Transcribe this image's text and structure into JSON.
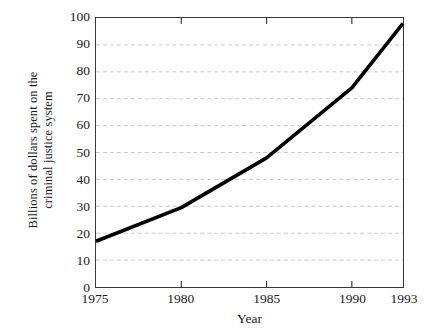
{
  "chart_data": {
    "type": "line",
    "title": "",
    "xlabel": "Year",
    "ylabel_lines": [
      "Billions of dollars spent on the",
      "criminal justice system"
    ],
    "ylabel": "Billions of dollars spent on the criminal justice system",
    "x": [
      1975,
      1980,
      1985,
      1990,
      1993
    ],
    "values": [
      17,
      29.5,
      48,
      74,
      98
    ],
    "series": [
      {
        "name": "Criminal justice spending",
        "values": [
          17,
          29.5,
          48,
          74,
          98
        ]
      }
    ],
    "xlim": [
      1975,
      1993
    ],
    "ylim": [
      0,
      100
    ],
    "xticks": [
      1975,
      1980,
      1985,
      1990,
      1993
    ],
    "xtick_labels": [
      "1975",
      "1980",
      "1985",
      "1990",
      "1993"
    ],
    "yticks": [
      0,
      10,
      20,
      30,
      40,
      50,
      60,
      70,
      80,
      90,
      100
    ],
    "ytick_labels": [
      "0",
      "10",
      "20",
      "30",
      "40",
      "50",
      "60",
      "70",
      "80",
      "90",
      "100"
    ],
    "grid": "horizontal-dashed",
    "grid_color": "#c9c9c9",
    "line_color": "#000000",
    "frame_color": "#3a3a3a",
    "legend": null,
    "legend_position": "none",
    "annotations": []
  }
}
